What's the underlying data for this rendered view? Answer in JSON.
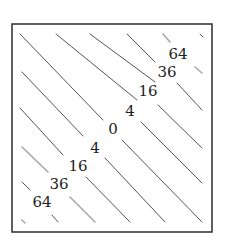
{
  "figure": {
    "frame": {
      "x1": 12,
      "y1": 24,
      "x2": 212,
      "y2": 232
    },
    "colors": {
      "frame": "#3a3a3a",
      "contour": "#555555",
      "faint": "#a8a8a8",
      "text": "#1e1e1e"
    }
  },
  "chart_data": {
    "type": "contour",
    "title": "",
    "xlabel": "",
    "ylabel": "",
    "function": "(x - y)^2",
    "levels": [
      0,
      4,
      16,
      36,
      64
    ],
    "labels": [
      {
        "text": "64",
        "x": 178,
        "y": 55
      },
      {
        "text": "36",
        "x": 167,
        "y": 73
      },
      {
        "text": "16",
        "x": 148,
        "y": 92
      },
      {
        "text": "4",
        "x": 130,
        "y": 112
      },
      {
        "text": "0",
        "x": 113,
        "y": 130
      },
      {
        "text": "4",
        "x": 95,
        "y": 149
      },
      {
        "text": "16",
        "x": 78,
        "y": 167
      },
      {
        "text": "36",
        "x": 59,
        "y": 185
      },
      {
        "text": "64",
        "x": 42,
        "y": 203
      }
    ],
    "segments": [
      {
        "x1": 20,
        "y1": 34,
        "x2": 103,
        "y2": 120,
        "faint": false
      },
      {
        "x1": 56,
        "y1": 34,
        "x2": 137,
        "y2": 100,
        "faint": false
      },
      {
        "x1": 90,
        "y1": 34,
        "x2": 155,
        "y2": 82,
        "faint": false
      },
      {
        "x1": 127,
        "y1": 34,
        "x2": 155,
        "y2": 62,
        "faint": false
      },
      {
        "x1": 163,
        "y1": 34,
        "x2": 170,
        "y2": 42,
        "faint": true
      },
      {
        "x1": 200,
        "y1": 34,
        "x2": 203,
        "y2": 37,
        "faint": false
      },
      {
        "x1": 195,
        "y1": 67,
        "x2": 202,
        "y2": 73,
        "faint": true
      },
      {
        "x1": 177,
        "y1": 83,
        "x2": 202,
        "y2": 110,
        "faint": false
      },
      {
        "x1": 158,
        "y1": 105,
        "x2": 202,
        "y2": 148,
        "faint": false
      },
      {
        "x1": 141,
        "y1": 122,
        "x2": 202,
        "y2": 183,
        "faint": false
      },
      {
        "x1": 122,
        "y1": 140,
        "x2": 202,
        "y2": 222,
        "faint": false
      },
      {
        "x1": 22,
        "y1": 72,
        "x2": 83,
        "y2": 136,
        "faint": false
      },
      {
        "x1": 20,
        "y1": 108,
        "x2": 63,
        "y2": 155,
        "faint": false
      },
      {
        "x1": 22,
        "y1": 147,
        "x2": 48,
        "y2": 172,
        "faint": true
      },
      {
        "x1": 22,
        "y1": 182,
        "x2": 30,
        "y2": 190,
        "faint": false
      },
      {
        "x1": 22,
        "y1": 220,
        "x2": 25,
        "y2": 223,
        "faint": true
      },
      {
        "x1": 105,
        "y1": 158,
        "x2": 165,
        "y2": 222,
        "faint": false
      },
      {
        "x1": 86,
        "y1": 177,
        "x2": 130,
        "y2": 222,
        "faint": false
      },
      {
        "x1": 70,
        "y1": 197,
        "x2": 95,
        "y2": 222,
        "faint": true
      },
      {
        "x1": 52,
        "y1": 215,
        "x2": 58,
        "y2": 222,
        "faint": false
      }
    ]
  }
}
